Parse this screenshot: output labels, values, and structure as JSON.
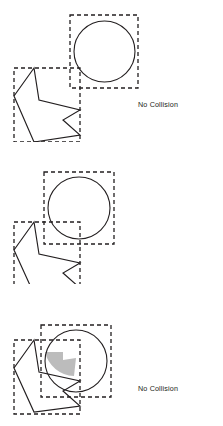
{
  "figure": {
    "width": 223,
    "height": 426,
    "background": "#ffffff",
    "stroke_color": "#231f20",
    "dash_color": "#231f20",
    "overlap_fill": "#bcbcbc",
    "caption_color": "#231f20"
  },
  "panels": [
    {
      "id": "panel-1",
      "caption": "No Collision",
      "circle": {
        "cx": 104.5,
        "cy": 51,
        "r": 30.5
      },
      "circle_box": {
        "x": 70,
        "y": 15,
        "w": 68,
        "h": 73
      },
      "arrow_box": {
        "x": 14,
        "y": 68,
        "w": 66,
        "h": 70
      },
      "overlap": false,
      "shaded_region": null
    },
    {
      "id": "panel-2",
      "caption": "No Collision",
      "circle": {
        "cx": 79,
        "cy": 208,
        "r": 31
      },
      "circle_box": {
        "x": 44,
        "y": 172,
        "w": 70,
        "h": 72
      },
      "arrow_box": {
        "x": 14,
        "y": 222,
        "w": 66,
        "h": 70
      },
      "overlap": false,
      "shaded_region": null
    },
    {
      "id": "panel-3",
      "caption": "Collision Detected",
      "circle": {
        "cx": 76,
        "cy": 361,
        "r": 31
      },
      "circle_box": {
        "x": 41,
        "y": 325,
        "w": 70,
        "h": 72
      },
      "arrow_box": {
        "x": 14,
        "y": 340,
        "w": 66,
        "h": 70
      },
      "overlap": true,
      "shaded_region": "circle-arrow intersection"
    }
  ],
  "captions": {
    "no_collision": "No Collision",
    "collision_detected": "Collision Detected"
  }
}
